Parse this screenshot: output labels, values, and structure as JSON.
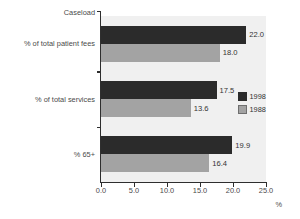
{
  "chart_data": {
    "type": "bar",
    "orientation": "horizontal",
    "title": "",
    "xlabel": "%",
    "ylabel": "",
    "corner_label": "Caseload",
    "categories": [
      "% of total patient fees",
      "% of total services",
      "% 65+"
    ],
    "series": [
      {
        "name": "1998",
        "color": "#2b2b2b",
        "values": [
          22.0,
          17.5,
          19.9
        ]
      },
      {
        "name": "1988",
        "color": "#a3a3a3",
        "values": [
          18.0,
          13.6,
          16.4
        ]
      }
    ],
    "value_labels": [
      [
        "22.0",
        "18.0"
      ],
      [
        "17.5",
        "13.6"
      ],
      [
        "19.9",
        "16.4"
      ]
    ],
    "xlim": [
      0.0,
      25.0
    ],
    "xticks": [
      0.0,
      5.0,
      10.0,
      15.0,
      20.0,
      25.0
    ],
    "xtick_labels": [
      "0.0",
      "5.0",
      "10.0",
      "15.0",
      "20.0",
      "25.0"
    ],
    "grid": false,
    "legend_position": "right-middle",
    "legend_entries": [
      "1998",
      "1988"
    ],
    "plot_background": "#f0f0f0",
    "page_background": "#ffffff"
  }
}
